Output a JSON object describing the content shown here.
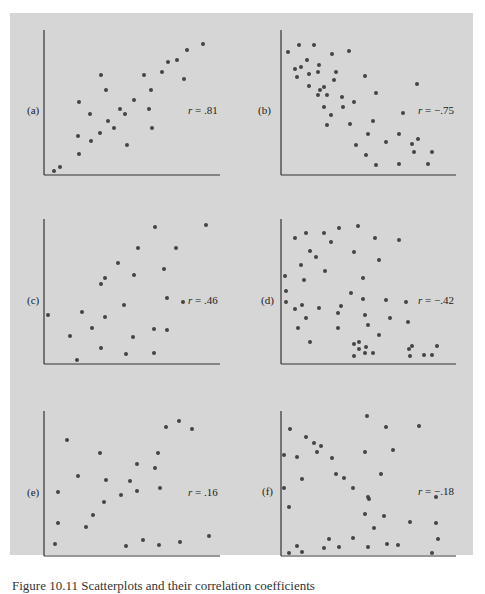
{
  "colors": {
    "background": "#d6d6d6",
    "axis": "#333333",
    "dot": "#444444"
  },
  "chart_data": [
    {
      "type": "scatter",
      "panel_label": "(a)",
      "annotation": "r = .81",
      "r": 0.81,
      "axes": {
        "x0": 44,
        "y0": 175,
        "top": 30,
        "right": 220
      },
      "label_pos": [
        27,
        110
      ],
      "r_pos": [
        188,
        110
      ],
      "points": [
        [
          54,
          171
        ],
        [
          60,
          167
        ],
        [
          79,
          102
        ],
        [
          78,
          136
        ],
        [
          79,
          154
        ],
        [
          90,
          114
        ],
        [
          91,
          141
        ],
        [
          100,
          133
        ],
        [
          101,
          75
        ],
        [
          106,
          90
        ],
        [
          108,
          121
        ],
        [
          114,
          128
        ],
        [
          120,
          109
        ],
        [
          125,
          114
        ],
        [
          127,
          145
        ],
        [
          134,
          100
        ],
        [
          144,
          75
        ],
        [
          149,
          109
        ],
        [
          151,
          90
        ],
        [
          152,
          128
        ],
        [
          162,
          72
        ],
        [
          168,
          62
        ],
        [
          177,
          60
        ],
        [
          184,
          79
        ],
        [
          187,
          50
        ],
        [
          203,
          44
        ]
      ]
    },
    {
      "type": "scatter",
      "panel_label": "(b)",
      "annotation": "r = −.75",
      "r": -0.75,
      "axes": {
        "x0": 41,
        "y0": 175,
        "top": 30,
        "right": 216
      },
      "label_pos": [
        18,
        110
      ],
      "r_pos": [
        178,
        110
      ],
      "points": [
        [
          48,
          52
        ],
        [
          59,
          45
        ],
        [
          74,
          45
        ],
        [
          92,
          54
        ],
        [
          109,
          51
        ],
        [
          67,
          60
        ],
        [
          79,
          65
        ],
        [
          55,
          69
        ],
        [
          61,
          67
        ],
        [
          69,
          74
        ],
        [
          78,
          72
        ],
        [
          96,
          72
        ],
        [
          57,
          77
        ],
        [
          94,
          80
        ],
        [
          69,
          86
        ],
        [
          80,
          90
        ],
        [
          84,
          87
        ],
        [
          78,
          95
        ],
        [
          87,
          95
        ],
        [
          102,
          97
        ],
        [
          114,
          102
        ],
        [
          125,
          76
        ],
        [
          136,
          93
        ],
        [
          84,
          107
        ],
        [
          103,
          107
        ],
        [
          91,
          115
        ],
        [
          87,
          125
        ],
        [
          110,
          124
        ],
        [
          133,
          121
        ],
        [
          163,
          113
        ],
        [
          177,
          84
        ],
        [
          128,
          134
        ],
        [
          159,
          134
        ],
        [
          116,
          145
        ],
        [
          146,
          142
        ],
        [
          172,
          144
        ],
        [
          178,
          139
        ],
        [
          126,
          155
        ],
        [
          174,
          152
        ],
        [
          192,
          152
        ],
        [
          136,
          165
        ],
        [
          159,
          164
        ],
        [
          188,
          164
        ]
      ]
    },
    {
      "type": "scatter",
      "panel_label": "(c)",
      "annotation": "r = .46",
      "r": 0.46,
      "axes": {
        "x0": 44,
        "y0": 174,
        "top": 29,
        "right": 220
      },
      "label_pos": [
        27,
        110
      ],
      "r_pos": [
        188,
        110
      ],
      "points": [
        [
          48,
          125
        ],
        [
          70,
          146
        ],
        [
          77,
          170
        ],
        [
          82,
          122
        ],
        [
          92,
          138
        ],
        [
          101,
          94
        ],
        [
          105,
          88
        ],
        [
          105,
          127
        ],
        [
          101,
          158
        ],
        [
          118,
          73
        ],
        [
          124,
          115
        ],
        [
          126,
          164
        ],
        [
          134,
          85
        ],
        [
          133,
          147
        ],
        [
          138,
          58
        ],
        [
          155,
          37
        ],
        [
          154,
          139
        ],
        [
          154,
          163
        ],
        [
          164,
          79
        ],
        [
          167,
          108
        ],
        [
          167,
          140
        ],
        [
          176,
          58
        ],
        [
          183,
          112
        ],
        [
          206,
          35
        ]
      ]
    },
    {
      "type": "scatter",
      "panel_label": "(d)",
      "annotation": "r = −.42",
      "r": -0.42,
      "axes": {
        "x0": 41,
        "y0": 174,
        "top": 29,
        "right": 216
      },
      "label_pos": [
        21,
        110
      ],
      "r_pos": [
        178,
        110
      ],
      "points": [
        [
          45,
          86
        ],
        [
          46,
          101
        ],
        [
          46,
          112
        ],
        [
          55,
          48
        ],
        [
          55,
          119
        ],
        [
          58,
          138
        ],
        [
          61,
          75
        ],
        [
          62,
          115
        ],
        [
          64,
          90
        ],
        [
          66,
          43
        ],
        [
          66,
          128
        ],
        [
          70,
          61
        ],
        [
          70,
          152
        ],
        [
          76,
          67
        ],
        [
          79,
          118
        ],
        [
          84,
          43
        ],
        [
          85,
          81
        ],
        [
          91,
          52
        ],
        [
          98,
          123
        ],
        [
          98,
          138
        ],
        [
          99,
          38
        ],
        [
          101,
          116
        ],
        [
          111,
          103
        ],
        [
          114,
          62
        ],
        [
          114,
          154
        ],
        [
          114,
          166
        ],
        [
          118,
          36
        ],
        [
          119,
          159
        ],
        [
          119,
          152
        ],
        [
          123,
          88
        ],
        [
          123,
          109
        ],
        [
          125,
          125
        ],
        [
          126,
          157
        ],
        [
          125,
          163
        ],
        [
          128,
          135
        ],
        [
          133,
          163
        ],
        [
          135,
          48
        ],
        [
          139,
          70
        ],
        [
          139,
          145
        ],
        [
          146,
          110
        ],
        [
          150,
          128
        ],
        [
          159,
          50
        ],
        [
          166,
          112
        ],
        [
          168,
          132
        ],
        [
          169,
          159
        ],
        [
          172,
          156
        ],
        [
          170,
          166
        ],
        [
          184,
          165
        ],
        [
          192,
          165
        ],
        [
          197,
          156
        ]
      ]
    },
    {
      "type": "scatter",
      "panel_label": "(e)",
      "annotation": "r = .16",
      "r": 0.16,
      "axes": {
        "x0": 44,
        "y0": 176,
        "top": 31,
        "right": 220
      },
      "label_pos": [
        27,
        112
      ],
      "r_pos": [
        188,
        112
      ],
      "points": [
        [
          55,
          164
        ],
        [
          58,
          143
        ],
        [
          58,
          112
        ],
        [
          67,
          60
        ],
        [
          78,
          96
        ],
        [
          86,
          147
        ],
        [
          93,
          135
        ],
        [
          100,
          73
        ],
        [
          104,
          122
        ],
        [
          106,
          100
        ],
        [
          121,
          115
        ],
        [
          126,
          166
        ],
        [
          130,
          101
        ],
        [
          137,
          111
        ],
        [
          137,
          84
        ],
        [
          143,
          160
        ],
        [
          155,
          88
        ],
        [
          158,
          73
        ],
        [
          160,
          108
        ],
        [
          159,
          165
        ],
        [
          166,
          47
        ],
        [
          179,
          41
        ],
        [
          180,
          162
        ],
        [
          192,
          49
        ],
        [
          209,
          156
        ]
      ]
    },
    {
      "type": "scatter",
      "panel_label": "(f)",
      "annotation": "r = −.18",
      "r": -0.18,
      "axes": {
        "x0": 41,
        "y0": 176,
        "top": 31,
        "right": 216
      },
      "label_pos": [
        22,
        111
      ],
      "r_pos": [
        178,
        111
      ],
      "points": [
        [
          50,
          49
        ],
        [
          44,
          75
        ],
        [
          44,
          108
        ],
        [
          49,
          127
        ],
        [
          49,
          173
        ],
        [
          57,
          77
        ],
        [
          57,
          166
        ],
        [
          62,
          172
        ],
        [
          62,
          99
        ],
        [
          66,
          57
        ],
        [
          74,
          63
        ],
        [
          77,
          72
        ],
        [
          81,
          66
        ],
        [
          84,
          168
        ],
        [
          89,
          159
        ],
        [
          92,
          78
        ],
        [
          96,
          94
        ],
        [
          99,
          167
        ],
        [
          104,
          98
        ],
        [
          113,
          108
        ],
        [
          113,
          158
        ],
        [
          125,
          72
        ],
        [
          127,
          36
        ],
        [
          128,
          117
        ],
        [
          129,
          119
        ],
        [
          125,
          134
        ],
        [
          128,
          167
        ],
        [
          134,
          148
        ],
        [
          141,
          94
        ],
        [
          144,
          136
        ],
        [
          146,
          47
        ],
        [
          147,
          164
        ],
        [
          153,
          70
        ],
        [
          158,
          165
        ],
        [
          170,
          142
        ],
        [
          179,
          46
        ],
        [
          192,
          173
        ],
        [
          196,
          117
        ],
        [
          196,
          143
        ],
        [
          198,
          159
        ]
      ]
    }
  ],
  "caption": "Figure 10.11  Scatterplots and their correlation coefficients"
}
